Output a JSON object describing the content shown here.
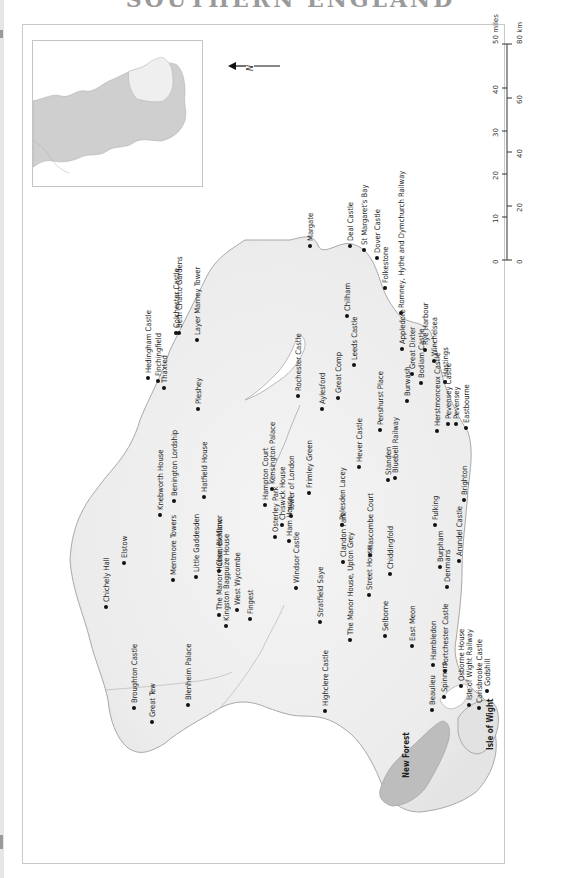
{
  "page": {
    "title": "SOUTHERN ENGLAND"
  },
  "compass": {
    "label": "N",
    "icon": "north-arrow-icon"
  },
  "scale_bar": {
    "miles_label": "50 miles",
    "km_label": "80 km",
    "miles_ticks": [
      "0",
      "10",
      "20",
      "30",
      "40"
    ],
    "km_ticks": [
      "0",
      "20",
      "40",
      "60"
    ]
  },
  "inset_map": {
    "description": "locator map of England with southern region highlighted",
    "region_fill": "#cfcfcf",
    "highlight_fill": "#efefef"
  },
  "colors": {
    "land": "#ececec",
    "coast": "#9a9a9a",
    "new_forest": "#bdbdbd",
    "dot": "#111111",
    "label": "#1e1e1e"
  },
  "places": [
    {
      "name": "Margate",
      "x": 310,
      "y": 246
    },
    {
      "name": "Deal Castle",
      "x": 350,
      "y": 246
    },
    {
      "name": "St Margaret's Bay",
      "x": 364,
      "y": 250
    },
    {
      "name": "Dover Castle",
      "x": 377,
      "y": 258
    },
    {
      "name": "Folkestone",
      "x": 385,
      "y": 288
    },
    {
      "name": "Romney, Hythe and Dymchurch Railway",
      "x": 401,
      "y": 313
    },
    {
      "name": "Chilham",
      "x": 347,
      "y": 316
    },
    {
      "name": "Leeds Castle",
      "x": 354,
      "y": 365
    },
    {
      "name": "Rye Harbour",
      "x": 425,
      "y": 350
    },
    {
      "name": "Winchelsea",
      "x": 434,
      "y": 361
    },
    {
      "name": "Great Dixter",
      "x": 412,
      "y": 374
    },
    {
      "name": "Appledore",
      "x": 402,
      "y": 349
    },
    {
      "name": "Hastings",
      "x": 445,
      "y": 382
    },
    {
      "name": "Bodiam Castle",
      "x": 421,
      "y": 383
    },
    {
      "name": "Pevensey",
      "x": 456,
      "y": 424
    },
    {
      "name": "Eastbourne",
      "x": 466,
      "y": 428
    },
    {
      "name": "Pevensey Castle",
      "x": 448,
      "y": 424
    },
    {
      "name": "Burwash",
      "x": 407,
      "y": 401
    },
    {
      "name": "Herstmonceux Castle",
      "x": 437,
      "y": 431
    },
    {
      "name": "Bluebell Railway",
      "x": 395,
      "y": 478
    },
    {
      "name": "Penshurst Place",
      "x": 380,
      "y": 430
    },
    {
      "name": "Great Comp",
      "x": 338,
      "y": 398
    },
    {
      "name": "Aylesford",
      "x": 322,
      "y": 409
    },
    {
      "name": "Rochester Castle",
      "x": 298,
      "y": 396
    },
    {
      "name": "Hever Castle",
      "x": 359,
      "y": 467
    },
    {
      "name": "Standen",
      "x": 388,
      "y": 480
    },
    {
      "name": "Brighton",
      "x": 464,
      "y": 500
    },
    {
      "name": "Fulking",
      "x": 435,
      "y": 525
    },
    {
      "name": "Burpham",
      "x": 440,
      "y": 567
    },
    {
      "name": "Arundel Castle",
      "x": 459,
      "y": 561
    },
    {
      "name": "Denmans",
      "x": 447,
      "y": 587
    },
    {
      "name": "Chiddingfold",
      "x": 390,
      "y": 574
    },
    {
      "name": "Hascombe Court",
      "x": 370,
      "y": 555
    },
    {
      "name": "Polesden Lacey",
      "x": 342,
      "y": 525
    },
    {
      "name": "Frimley Green",
      "x": 309,
      "y": 493
    },
    {
      "name": "Tower of London",
      "x": 291,
      "y": 516
    },
    {
      "name": "Kensington Palace",
      "x": 272,
      "y": 489
    },
    {
      "name": "Chiswick House",
      "x": 282,
      "y": 525
    },
    {
      "name": "Hampton Court",
      "x": 265,
      "y": 505
    },
    {
      "name": "Osterley Park",
      "x": 275,
      "y": 537
    },
    {
      "name": "Ham House",
      "x": 289,
      "y": 541
    },
    {
      "name": "Windsor Castle",
      "x": 296,
      "y": 588
    },
    {
      "name": "Stratfield Saye",
      "x": 320,
      "y": 622
    },
    {
      "name": "Clandon Park",
      "x": 343,
      "y": 562
    },
    {
      "name": "Street House",
      "x": 369,
      "y": 595
    },
    {
      "name": "East Meon",
      "x": 412,
      "y": 646
    },
    {
      "name": "Selborne",
      "x": 385,
      "y": 636
    },
    {
      "name": "The Manor House, Upton Grey",
      "x": 350,
      "y": 640
    },
    {
      "name": "Highclere Castle",
      "x": 325,
      "y": 711
    },
    {
      "name": "Hambledon",
      "x": 433,
      "y": 665
    },
    {
      "name": "Portchester Castle",
      "x": 445,
      "y": 671
    },
    {
      "name": "Osborne House",
      "x": 461,
      "y": 686
    },
    {
      "name": "Isle of Wight Railway",
      "x": 469,
      "y": 705
    },
    {
      "name": "Godshill",
      "x": 487,
      "y": 691
    },
    {
      "name": "Carisbrooke Castle",
      "x": 479,
      "y": 708
    },
    {
      "name": "Spinners",
      "x": 444,
      "y": 697
    },
    {
      "name": "Beaulieu",
      "x": 432,
      "y": 710
    },
    {
      "name": "New Forest",
      "x": 406,
      "y": 778,
      "bold": true
    },
    {
      "name": "Isle of Wight",
      "x": 490,
      "y": 750,
      "bold": true
    },
    {
      "name": "Hedingham Castle",
      "x": 148,
      "y": 378
    },
    {
      "name": "Finchingfield",
      "x": 158,
      "y": 381
    },
    {
      "name": "Thaxted",
      "x": 164,
      "y": 388
    },
    {
      "name": "Colchester Castle",
      "x": 176,
      "y": 333
    },
    {
      "name": "Beth Chatto Gardens",
      "x": 179,
      "y": 333
    },
    {
      "name": "Layer Marney Tower",
      "x": 197,
      "y": 340
    },
    {
      "name": "Pleshey",
      "x": 198,
      "y": 409
    },
    {
      "name": "Benington Lordship",
      "x": 174,
      "y": 501
    },
    {
      "name": "Hatfield House",
      "x": 204,
      "y": 497
    },
    {
      "name": "Knebworth House",
      "x": 160,
      "y": 515
    },
    {
      "name": "Elstow",
      "x": 124,
      "y": 563
    },
    {
      "name": "Chichely Hall",
      "x": 106,
      "y": 607
    },
    {
      "name": "Little Gaddesden",
      "x": 196,
      "y": 577
    },
    {
      "name": "Chenies Manor",
      "x": 219,
      "y": 571
    },
    {
      "name": "West Wycombe",
      "x": 237,
      "y": 610
    },
    {
      "name": "Fingest",
      "x": 250,
      "y": 619
    },
    {
      "name": "Mentmore Towers",
      "x": 173,
      "y": 580
    },
    {
      "name": "The Manor House, Bledlow",
      "x": 219,
      "y": 615
    },
    {
      "name": "Kingston Bagpuize House",
      "x": 226,
      "y": 626
    },
    {
      "name": "Blenheim Palace",
      "x": 188,
      "y": 705
    },
    {
      "name": "Broughton Castle",
      "x": 134,
      "y": 708
    },
    {
      "name": "Great Tew",
      "x": 152,
      "y": 722
    }
  ]
}
